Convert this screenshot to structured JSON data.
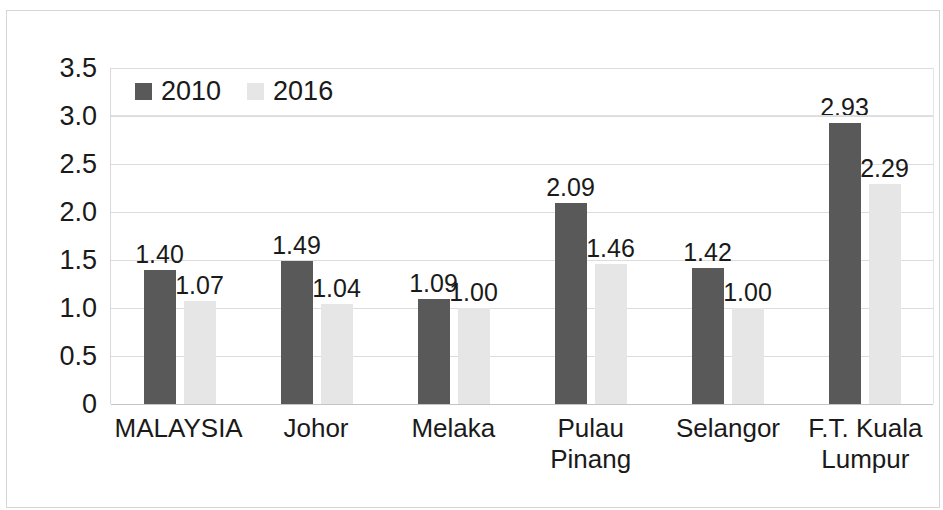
{
  "chart_data": {
    "type": "bar",
    "title": "",
    "subtitle": "",
    "xlabel": "",
    "ylabel": "",
    "ylim": [
      0,
      3.5
    ],
    "ytick_labels": [
      "3.5",
      "3.0",
      "2.5",
      "2.0",
      "1.5",
      "1.0",
      "0.5",
      "0"
    ],
    "ytick_values": [
      3.5,
      3.0,
      2.5,
      2.0,
      1.5,
      1.0,
      0.5,
      0
    ],
    "grid": true,
    "legend_position": "top-left-inside",
    "categories": [
      "MALAYSIA",
      "Johor",
      "Melaka",
      "Pulau Pinang",
      "Selangor",
      "F.T. Kuala Lumpur"
    ],
    "series": [
      {
        "name": "2010",
        "color": "#595959",
        "values": [
          1.4,
          1.49,
          1.09,
          2.09,
          1.42,
          2.93
        ],
        "labels": [
          "1.40",
          "1.49",
          "1.09",
          "2.09",
          "1.42",
          "2.93"
        ]
      },
      {
        "name": "2016",
        "color": "#e6e6e6",
        "values": [
          1.07,
          1.04,
          1.0,
          1.46,
          1.0,
          2.29
        ],
        "labels": [
          "1.07",
          "1.04",
          "1.00",
          "1.46",
          "1.00",
          "2.29"
        ]
      }
    ]
  }
}
